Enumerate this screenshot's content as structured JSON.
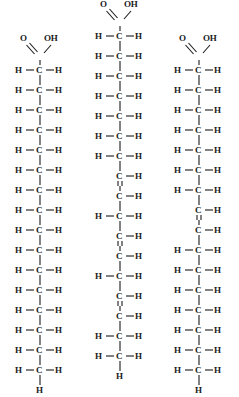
{
  "figure": {
    "background_color": "#ffffff",
    "atom_color": "#1a1a1a",
    "bond_color": "#1a1a1a",
    "atoms": {
      "carbon": "C",
      "hydrogen": "H",
      "oxygen": "O",
      "hydroxyl": "OH"
    },
    "molecules": [
      {
        "id": "saturated-fatty-acid",
        "name": "Saturated fatty acid",
        "position": "left",
        "left_px": 0,
        "top_offset_px": 34,
        "head_group": "COOH",
        "double_bond_count": 0,
        "carbon_count": 18,
        "terminal_group": "CH3",
        "rows": [
          {
            "type": "CH2",
            "bond_below": "single"
          },
          {
            "type": "CH2",
            "bond_below": "single"
          },
          {
            "type": "CH2",
            "bond_below": "single"
          },
          {
            "type": "CH2",
            "bond_below": "single"
          },
          {
            "type": "CH2",
            "bond_below": "single"
          },
          {
            "type": "CH2",
            "bond_below": "single"
          },
          {
            "type": "CH2",
            "bond_below": "single"
          },
          {
            "type": "CH2",
            "bond_below": "single"
          },
          {
            "type": "CH2",
            "bond_below": "single"
          },
          {
            "type": "CH2",
            "bond_below": "single"
          },
          {
            "type": "CH2",
            "bond_below": "single"
          },
          {
            "type": "CH2",
            "bond_below": "single"
          },
          {
            "type": "CH2",
            "bond_below": "single"
          },
          {
            "type": "CH2",
            "bond_below": "single"
          },
          {
            "type": "CH2",
            "bond_below": "single"
          },
          {
            "type": "CH2",
            "bond_below": "terminal"
          }
        ]
      },
      {
        "id": "polyunsaturated-fatty-acid",
        "name": "Polyunsaturated fatty acid",
        "position": "center",
        "left_px": 80,
        "top_offset_px": 0,
        "head_group": "COOH",
        "double_bond_count": 3,
        "carbon_count": 19,
        "terminal_group": "CH3",
        "rows": [
          {
            "type": "CH2",
            "bond_below": "single"
          },
          {
            "type": "CH2",
            "bond_below": "single"
          },
          {
            "type": "CH2",
            "bond_below": "single"
          },
          {
            "type": "CH2",
            "bond_below": "single"
          },
          {
            "type": "CH2",
            "bond_below": "single"
          },
          {
            "type": "CH2",
            "bond_below": "single"
          },
          {
            "type": "CH2",
            "bond_below": "single"
          },
          {
            "type": "CH",
            "bond_below": "double"
          },
          {
            "type": "CH",
            "bond_below": "single"
          },
          {
            "type": "CH2",
            "bond_below": "single"
          },
          {
            "type": "CH",
            "bond_below": "double"
          },
          {
            "type": "CH",
            "bond_below": "single"
          },
          {
            "type": "CH2",
            "bond_below": "single"
          },
          {
            "type": "CH",
            "bond_below": "double"
          },
          {
            "type": "CH",
            "bond_below": "single"
          },
          {
            "type": "CH2",
            "bond_below": "single"
          },
          {
            "type": "CH2",
            "bond_below": "terminal"
          }
        ]
      },
      {
        "id": "monounsaturated-fatty-acid",
        "name": "Monounsaturated fatty acid",
        "position": "right",
        "left_px": 159,
        "top_offset_px": 34,
        "head_group": "COOH",
        "double_bond_count": 1,
        "carbon_count": 18,
        "terminal_group": "CH3",
        "rows": [
          {
            "type": "CH2",
            "bond_below": "single"
          },
          {
            "type": "CH2",
            "bond_below": "single"
          },
          {
            "type": "CH2",
            "bond_below": "single"
          },
          {
            "type": "CH2",
            "bond_below": "single"
          },
          {
            "type": "CH2",
            "bond_below": "single"
          },
          {
            "type": "CH2",
            "bond_below": "single"
          },
          {
            "type": "CH2",
            "bond_below": "single"
          },
          {
            "type": "CH",
            "bond_below": "double"
          },
          {
            "type": "CH",
            "bond_below": "single"
          },
          {
            "type": "CH2",
            "bond_below": "single"
          },
          {
            "type": "CH2",
            "bond_below": "single"
          },
          {
            "type": "CH2",
            "bond_below": "single"
          },
          {
            "type": "CH2",
            "bond_below": "single"
          },
          {
            "type": "CH2",
            "bond_below": "single"
          },
          {
            "type": "CH2",
            "bond_below": "single"
          },
          {
            "type": "CH2",
            "bond_below": "terminal"
          }
        ]
      }
    ]
  }
}
